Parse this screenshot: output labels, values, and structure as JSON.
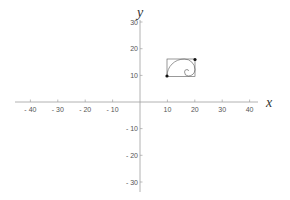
{
  "diagram": {
    "type": "coordinate-plane",
    "x_axis": {
      "label": "x",
      "ticks": [
        -40,
        -30,
        -20,
        -10,
        10,
        20,
        30,
        40
      ],
      "tick_labels": [
        "- 40",
        "- 30",
        "- 20",
        "- 10",
        "10",
        "20",
        "30",
        "40"
      ]
    },
    "y_axis": {
      "label": "y",
      "ticks": [
        30,
        20,
        10,
        -10,
        -20,
        -30
      ],
      "tick_labels": [
        "30",
        "20",
        "10",
        "- 10",
        "- 20",
        "- 30"
      ]
    },
    "figure": {
      "description": "golden rectangle with inscribed golden spiral",
      "rectangle": {
        "x_min": 10,
        "x_max": 20.5,
        "y_min": 9.5,
        "y_max": 16
      },
      "points": [
        {
          "x": 10,
          "y": 10
        },
        {
          "x": 20,
          "y": 16
        }
      ]
    },
    "colors": {
      "axis": "#999999",
      "figure": "#555555",
      "points": "#111111"
    }
  }
}
